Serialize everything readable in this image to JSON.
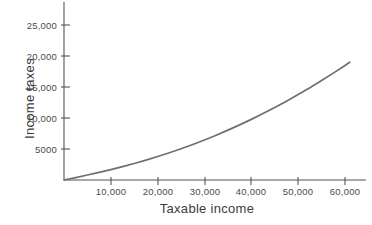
{
  "chart_data": {
    "type": "line",
    "title": "",
    "xlabel": "Taxable income",
    "ylabel": "Income taxes",
    "xlim": [
      0,
      64000
    ],
    "ylim": [
      0,
      26500
    ],
    "grid": false,
    "legend": null,
    "x_tick_labels": [
      "10,000",
      "20,000",
      "30,000",
      "40,000",
      "50,000",
      "60,000"
    ],
    "x_ticks": [
      10000,
      20000,
      30000,
      40000,
      50000,
      60000
    ],
    "y_tick_labels": [
      "5000",
      "10,000",
      "15,000",
      "20,000",
      "25,000"
    ],
    "y_ticks": [
      5000,
      10000,
      15000,
      20000,
      25000
    ],
    "series": [
      {
        "name": "Income taxes",
        "color": "#6f6f6f",
        "x": [
          0,
          2500,
          5000,
          7500,
          10000,
          12500,
          15000,
          17500,
          20000,
          22500,
          25000,
          27500,
          30000,
          32500,
          35000,
          37500,
          40000,
          42500,
          45000,
          47500,
          50000,
          52500,
          55000,
          57500,
          60000,
          61000
        ],
        "values": [
          0,
          390,
          800,
          1230,
          1680,
          2160,
          2670,
          3210,
          3780,
          4390,
          5040,
          5730,
          6460,
          7230,
          8040,
          8890,
          9780,
          10720,
          11700,
          12720,
          13780,
          14890,
          16040,
          17240,
          18480,
          19000
        ]
      }
    ]
  },
  "axis": {
    "line_color": "#555555",
    "tick_color": "#555555"
  }
}
